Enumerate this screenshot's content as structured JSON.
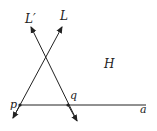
{
  "diagram": {
    "labels": {
      "line_L": "L",
      "line_L_prime": "L′",
      "half_plane": "H",
      "point_p": "p",
      "point_q": "q",
      "point_a": "a"
    },
    "colors": {
      "stroke": "#222222",
      "background": "#ffffff"
    }
  }
}
